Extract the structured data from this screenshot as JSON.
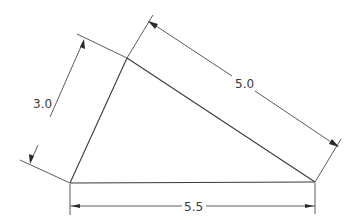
{
  "diagram": {
    "type": "triangle-dimension-drawing",
    "vertices": {
      "A": {
        "x": 70,
        "y": 183
      },
      "B": {
        "x": 127,
        "y": 58
      },
      "C": {
        "x": 315,
        "y": 182
      }
    },
    "dimensions": [
      {
        "id": "side-ab",
        "label": "3.0",
        "from": "A",
        "to": "B"
      },
      {
        "id": "side-bc",
        "label": "5.0",
        "from": "B",
        "to": "C"
      },
      {
        "id": "side-ac",
        "label": "5.5",
        "from": "A",
        "to": "C"
      }
    ],
    "colors": {
      "line": "#3a3a3a",
      "background": "#ffffff"
    }
  }
}
